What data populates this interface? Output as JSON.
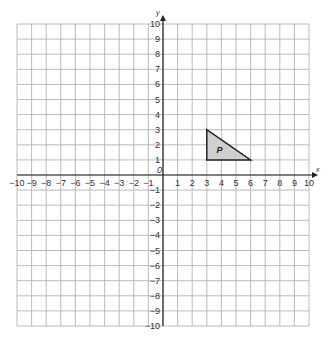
{
  "diagram": {
    "type": "coordinate-grid",
    "x_axis": {
      "label": "x",
      "min": -10,
      "max": 10,
      "ticks": [
        -10,
        -9,
        -8,
        -7,
        -6,
        -5,
        -4,
        -3,
        -2,
        -1,
        1,
        2,
        3,
        4,
        5,
        6,
        7,
        8,
        9,
        10
      ]
    },
    "y_axis": {
      "label": "y",
      "min": -10,
      "max": 10,
      "ticks": [
        -10,
        -9,
        -8,
        -7,
        -6,
        -5,
        -4,
        -3,
        -2,
        -1,
        1,
        2,
        3,
        4,
        5,
        6,
        7,
        8,
        9,
        10
      ]
    },
    "origin_label": "0",
    "shapes": [
      {
        "name": "P",
        "label": "P",
        "vertices": [
          [
            3,
            3
          ],
          [
            3,
            1
          ],
          [
            6,
            1
          ]
        ],
        "fill": "#cfcfcf",
        "stroke": "#222222"
      }
    ],
    "colors": {
      "grid": "#aaaaaa",
      "axis": "#222222",
      "text": "#333333"
    }
  }
}
